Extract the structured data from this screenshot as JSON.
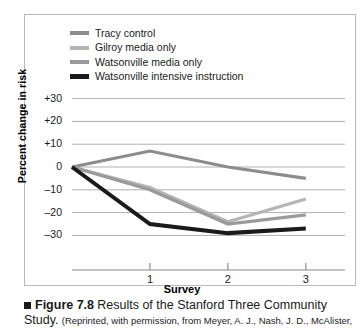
{
  "figure": {
    "marker_icon": "square-bullet-icon",
    "number": "Figure 7.8",
    "title": "Results of the Stanford Three Community",
    "title_cont": "Study.",
    "source": "(Reprinted, with permission, from Meyer, A. J., Nash, J. D., McAlister,"
  },
  "colors": {
    "tracy": "#8c8c8c",
    "gilroy": "#b5b5b5",
    "watsonville_media": "#9a9a9a",
    "watsonville_intensive": "#1a1a1a",
    "gridline": "#b0b0b0",
    "axis": "#8a8a8a",
    "frame": "#b9b9b9"
  },
  "chart_data": {
    "type": "line",
    "title": "Results of the Stanford Three Community Study",
    "xlabel": "Survey",
    "ylabel": "Percent change in risk",
    "x": [
      0,
      1,
      2,
      3
    ],
    "xtick_labels": [
      "1",
      "2",
      "3"
    ],
    "xtick_values": [
      1,
      2,
      3
    ],
    "ytick_labels": [
      "+30",
      "+20",
      "+10",
      "0",
      "–10",
      "–20",
      "–30"
    ],
    "ytick_values": [
      30,
      20,
      10,
      0,
      -10,
      -20,
      -30
    ],
    "ylim": [
      -33,
      33
    ],
    "xlim": [
      -0.3,
      3.4
    ],
    "grid": true,
    "legend_position": "top-left",
    "series": [
      {
        "name": "Tracy control",
        "color": "#8c8c8c",
        "width": 3.2,
        "values": [
          0,
          7,
          0,
          -5
        ]
      },
      {
        "name": "Gilroy media only",
        "color": "#b5b5b5",
        "width": 3.2,
        "values": [
          0,
          -9,
          -24,
          -14
        ]
      },
      {
        "name": "Watsonville media only",
        "color": "#9a9a9a",
        "width": 3.2,
        "values": [
          0,
          -10,
          -25,
          -21
        ]
      },
      {
        "name": "Watsonville intensive instruction",
        "color": "#1a1a1a",
        "width": 4.0,
        "values": [
          0,
          -25,
          -29,
          -27
        ]
      }
    ]
  }
}
